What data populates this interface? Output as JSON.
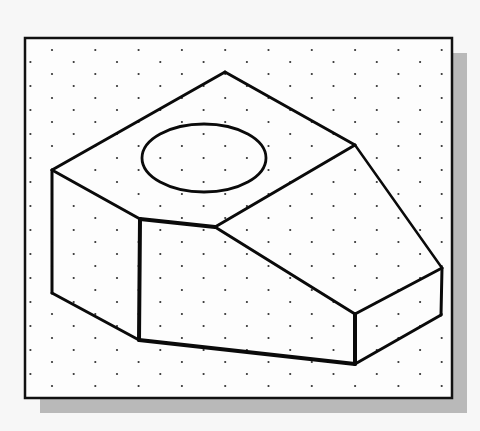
{
  "figure": {
    "colors": {
      "page_background": "#f7f7f7",
      "frame_fill": "#fdfdfd",
      "frame_stroke": "#111111",
      "shadow": "#b9b9b9",
      "line": "#0a0a0a",
      "dot": "#333333"
    },
    "frame": {
      "x": 25,
      "y": 38,
      "width": 427,
      "height": 360
    },
    "shadow": {
      "dx": 15,
      "dy": 15
    },
    "dot_grid": {
      "x0": 52,
      "y0": 50,
      "dx": 43.3,
      "dy": 12,
      "stagger": -21.65
    },
    "object": {
      "vertices": {
        "apex": [
          225,
          72
        ],
        "top_left": [
          52,
          170
        ],
        "bottom_left": [
          52,
          293
        ],
        "front_left_top": [
          140,
          219
        ],
        "front_left_bottom": [
          139,
          340
        ],
        "notch": [
          215,
          227
        ],
        "slope_top": [
          355,
          145
        ],
        "right_top": [
          442,
          268
        ],
        "right_bottom": [
          441,
          315
        ],
        "front_right_top": [
          355,
          314
        ],
        "front_right_bottom": [
          355,
          364
        ]
      },
      "hole": {
        "cx": 204,
        "cy": 158,
        "rx": 62,
        "ry": 34
      }
    }
  }
}
